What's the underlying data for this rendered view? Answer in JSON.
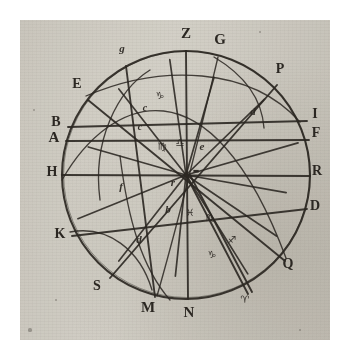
{
  "figure": {
    "kind": "astronomical-diagram",
    "ink_color": "#2b2722",
    "paper_color": "#d6d3cb",
    "margin_color": "#ffffff"
  },
  "circle": {
    "center_x": 186,
    "center_y": 175,
    "radius": 124
  },
  "rim_labels": [
    {
      "id": "Z",
      "text": "Z",
      "x": 186,
      "y": 38,
      "size": 15,
      "style": "roman-bold"
    },
    {
      "id": "G",
      "text": "G",
      "x": 220,
      "y": 44,
      "size": 15,
      "style": "roman-bold"
    },
    {
      "id": "P",
      "text": "P",
      "x": 280,
      "y": 73,
      "size": 14,
      "style": "roman-bold"
    },
    {
      "id": "I",
      "text": "I",
      "x": 315,
      "y": 118,
      "size": 14,
      "style": "roman-bold"
    },
    {
      "id": "F",
      "text": "F",
      "x": 316,
      "y": 137,
      "size": 14,
      "style": "roman-bold"
    },
    {
      "id": "R",
      "text": "R",
      "x": 317,
      "y": 175,
      "size": 14,
      "style": "roman-bold"
    },
    {
      "id": "D",
      "text": "D",
      "x": 315,
      "y": 210,
      "size": 14,
      "style": "roman-bold"
    },
    {
      "id": "Q",
      "text": "Q",
      "x": 288,
      "y": 268,
      "size": 14,
      "style": "roman-bold"
    },
    {
      "id": "N",
      "text": "N",
      "x": 189,
      "y": 317,
      "size": 15,
      "style": "roman-bold"
    },
    {
      "id": "M",
      "text": "M",
      "x": 148,
      "y": 312,
      "size": 15,
      "style": "roman-bold"
    },
    {
      "id": "S",
      "text": "S",
      "x": 97,
      "y": 290,
      "size": 14,
      "style": "roman-bold"
    },
    {
      "id": "K",
      "text": "K",
      "x": 60,
      "y": 238,
      "size": 14,
      "style": "roman-bold"
    },
    {
      "id": "H",
      "text": "H",
      "x": 52,
      "y": 176,
      "size": 14,
      "style": "roman-bold"
    },
    {
      "id": "A",
      "text": "A",
      "x": 54,
      "y": 142,
      "size": 15,
      "style": "roman-bold"
    },
    {
      "id": "B",
      "text": "B",
      "x": 56,
      "y": 126,
      "size": 14,
      "style": "roman-bold"
    },
    {
      "id": "E",
      "text": "E",
      "x": 77,
      "y": 88,
      "size": 14,
      "style": "roman-bold"
    }
  ],
  "inner_marks": [
    {
      "id": "g-upper-left",
      "text": "g",
      "x": 122,
      "y": 52,
      "size": 11,
      "style": "italic"
    },
    {
      "id": "glyph-aquarius-upper",
      "text": "♑",
      "x": 160,
      "y": 99,
      "size": 10,
      "style": "glyph"
    },
    {
      "id": "c-upper",
      "text": "c",
      "x": 145,
      "y": 111,
      "size": 10,
      "style": "italic"
    },
    {
      "id": "c-lower",
      "text": "c",
      "x": 140,
      "y": 130,
      "size": 10,
      "style": "italic"
    },
    {
      "id": "glyph-virgo",
      "text": "♍",
      "x": 162,
      "y": 150,
      "size": 10,
      "style": "glyph"
    },
    {
      "id": "glyph-libra",
      "text": "♎",
      "x": 180,
      "y": 146,
      "size": 10,
      "style": "glyph"
    },
    {
      "id": "e-center-right",
      "text": "e",
      "x": 202,
      "y": 150,
      "size": 11,
      "style": "italic"
    },
    {
      "id": "d-right",
      "text": "d",
      "x": 253,
      "y": 115,
      "size": 11,
      "style": "italic"
    },
    {
      "id": "hub-mark",
      "text": "▬",
      "x": 196,
      "y": 173,
      "size": 7,
      "style": "glyph"
    },
    {
      "id": "r-center",
      "text": "r",
      "x": 173,
      "y": 186,
      "size": 11,
      "style": "italic"
    },
    {
      "id": "f-left",
      "text": "f",
      "x": 121,
      "y": 190,
      "size": 11,
      "style": "italic"
    },
    {
      "id": "b-lower",
      "text": "b",
      "x": 168,
      "y": 213,
      "size": 11,
      "style": "italic"
    },
    {
      "id": "glyph-pisces",
      "text": "♓",
      "x": 190,
      "y": 216,
      "size": 10,
      "style": "glyph"
    },
    {
      "id": "glyph-scorpio",
      "text": "♏",
      "x": 210,
      "y": 221,
      "size": 10,
      "style": "glyph"
    },
    {
      "id": "glyph-sagittarius",
      "text": "♐",
      "x": 232,
      "y": 243,
      "size": 10,
      "style": "glyph"
    },
    {
      "id": "glyph-capricorn",
      "text": "♑",
      "x": 212,
      "y": 258,
      "size": 10,
      "style": "glyph"
    },
    {
      "id": "d-lower-left",
      "text": "d",
      "x": 139,
      "y": 243,
      "size": 11,
      "style": "italic"
    },
    {
      "id": "glyph-aries-rim",
      "text": "♈",
      "x": 245,
      "y": 303,
      "size": 10,
      "style": "glyph"
    }
  ],
  "chords": [
    {
      "id": "chord-B-I",
      "x1": 68,
      "y1": 127,
      "x2": 307,
      "y2": 121
    },
    {
      "id": "chord-A-F",
      "x1": 66,
      "y1": 141,
      "x2": 309,
      "y2": 140
    },
    {
      "id": "chord-H-R",
      "x1": 62,
      "y1": 175,
      "x2": 310,
      "y2": 176
    },
    {
      "id": "chord-K-D",
      "x1": 72,
      "y1": 236,
      "x2": 307,
      "y2": 209
    },
    {
      "id": "chord-Z-N",
      "x1": 186,
      "y1": 51,
      "x2": 188,
      "y2": 299
    },
    {
      "id": "chord-E-Q",
      "x1": 88,
      "y1": 100,
      "x2": 285,
      "y2": 261
    },
    {
      "id": "chord-g-M",
      "x1": 126,
      "y1": 66,
      "x2": 155,
      "y2": 297
    },
    {
      "id": "chord-S-P",
      "x1": 110,
      "y1": 278,
      "x2": 277,
      "y2": 85
    },
    {
      "id": "chord-hub-aries",
      "x1": 186,
      "y1": 175,
      "x2": 248,
      "y2": 294
    },
    {
      "id": "chord-hub-aries-2",
      "x1": 190,
      "y1": 175,
      "x2": 252,
      "y2": 292
    }
  ],
  "arcs": [
    {
      "id": "arc-G-M",
      "d": "M 218 57 C 196 150, 176 230, 157 296"
    },
    {
      "id": "arc-Z-Q",
      "d": "M 62 180 C 110 96, 210 54, 286 258"
    },
    {
      "id": "arc-E-P",
      "d": "M 86 96 C 160 64, 250 66, 300 122"
    },
    {
      "id": "arc-G-d",
      "d": "M 214 57 C 246 76, 262 100, 264 128"
    },
    {
      "id": "arc-K-S",
      "d": "M 70 232 C 108 225, 140 250, 152 290"
    },
    {
      "id": "arc-top-left",
      "d": "M 100 200 C 92 140, 118 90, 150 70"
    },
    {
      "id": "arc-bottom-sweep",
      "d": "M 120 156 C 128 220, 142 268, 170 300"
    }
  ],
  "specks": [
    {
      "x": 34,
      "y": 110,
      "r": 1.4
    },
    {
      "x": 30,
      "y": 330,
      "r": 1.6
    },
    {
      "x": 300,
      "y": 330,
      "r": 1.1
    },
    {
      "x": 56,
      "y": 300,
      "r": 1.0
    },
    {
      "x": 260,
      "y": 32,
      "r": 1.0
    }
  ]
}
